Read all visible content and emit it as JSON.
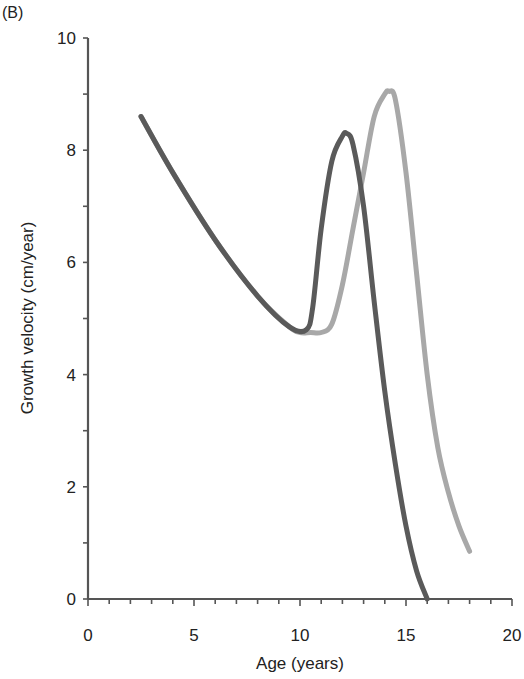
{
  "panel_label": "(B)",
  "chart_data": {
    "type": "line",
    "title": "",
    "xlabel": "Age (years)",
    "ylabel": "Growth velocity (cm/year)",
    "xlim": [
      0,
      20
    ],
    "ylim": [
      0,
      10
    ],
    "xticks": [
      0,
      5,
      10,
      15,
      20
    ],
    "yticks": [
      0,
      2,
      4,
      6,
      8,
      10
    ],
    "grid": false,
    "legend": null,
    "series": [
      {
        "name": "dark curve (earlier peak)",
        "color": "#5a5a5a",
        "x": [
          2.5,
          4,
          6,
          8,
          9.5,
          10.3,
          10.6,
          11,
          11.5,
          12,
          12.2,
          12.5,
          13,
          13.5,
          14,
          14.5,
          15,
          15.5,
          16
        ],
        "y": [
          8.6,
          7.6,
          6.4,
          5.4,
          4.85,
          4.8,
          5.2,
          6.6,
          7.8,
          8.25,
          8.3,
          8.1,
          7.0,
          5.3,
          3.7,
          2.4,
          1.3,
          0.5,
          0
        ]
      },
      {
        "name": "light curve (later peak)",
        "color": "#a8a8a8",
        "x": [
          2.5,
          4,
          6,
          8,
          9.5,
          10,
          10.5,
          11,
          11.5,
          12,
          12.5,
          13,
          13.5,
          14,
          14.2,
          14.5,
          15,
          15.5,
          16,
          16.5,
          17,
          17.5,
          18
        ],
        "y": [
          8.6,
          7.6,
          6.4,
          5.4,
          4.85,
          4.75,
          4.75,
          4.75,
          4.9,
          5.6,
          6.6,
          7.6,
          8.6,
          9.0,
          9.05,
          8.9,
          7.6,
          5.8,
          4.0,
          2.7,
          1.9,
          1.3,
          0.85
        ]
      }
    ]
  }
}
